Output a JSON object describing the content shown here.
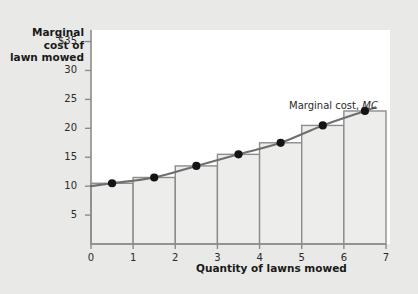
{
  "chart_data": {
    "type": "bar",
    "title": "",
    "subtitle": "",
    "ylabel": "Marginal\ncost of\nlawn mowed",
    "ylabel_lines": [
      "Marginal",
      "cost of",
      "lawn mowed"
    ],
    "xlabel": "Quantity of lawns mowed",
    "xlim": [
      0,
      7
    ],
    "ylim": [
      0,
      37
    ],
    "grid": false,
    "legend_position": "inline-annotation",
    "annotations": [
      {
        "text_plain": "Marginal cost, ",
        "text_italic": "MC",
        "x": 5.0,
        "y": 27
      }
    ],
    "xticks": [
      0,
      1,
      2,
      3,
      4,
      5,
      6,
      7
    ],
    "xtick_labels": [
      "0",
      "1",
      "2",
      "3",
      "4",
      "5",
      "6",
      "7"
    ],
    "yticks": [
      5,
      10,
      15,
      20,
      25,
      30,
      35
    ],
    "ytick_labels": [
      "5",
      "10",
      "15",
      "20",
      "25",
      "30",
      "$35"
    ],
    "categories": [
      "1st lawn",
      "2nd lawn",
      "3rd lawn",
      "4th lawn",
      "5th lawn",
      "6th lawn",
      "7th lawn"
    ],
    "bar_ranges": [
      [
        0,
        1
      ],
      [
        1,
        2
      ],
      [
        2,
        3
      ],
      [
        3,
        4
      ],
      [
        4,
        5
      ],
      [
        5,
        6
      ],
      [
        6,
        7
      ]
    ],
    "values": [
      10.5,
      11.5,
      13.5,
      15.5,
      17.5,
      20.5,
      23.0
    ],
    "series": [
      {
        "name": "Marginal cost, MC",
        "type": "line",
        "x": [
          0.5,
          1.5,
          2.5,
          3.5,
          4.5,
          5.5,
          6.5
        ],
        "values": [
          10.5,
          11.5,
          13.5,
          15.5,
          17.5,
          20.5,
          23.0
        ],
        "markers": true
      }
    ],
    "colors": {
      "bar_fill": "#ededeb",
      "bar_stroke": "#8c8c8c",
      "curve": "#6e6e6e",
      "marker": "#141414",
      "axis": "#8c8c8c",
      "plot_background": "#ffffff",
      "page_background": "#e9e9e7",
      "text": "#1a1a1a"
    }
  }
}
